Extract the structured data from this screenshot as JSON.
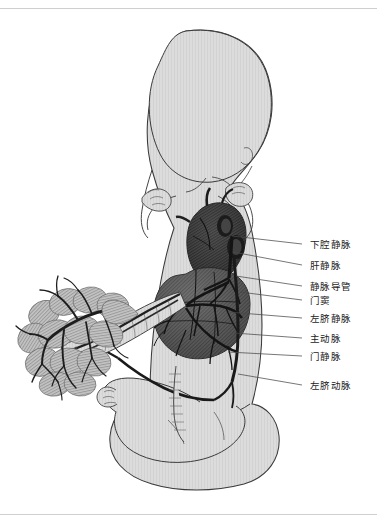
{
  "figure": {
    "type": "anatomical-illustration",
    "palette": {
      "background": "#ffffff",
      "body_fill": "#dcdcdc",
      "body_outline": "#3a3a3a",
      "organ_dark": "#2e2e2e",
      "organ_mid": "#575757",
      "organ_light": "#8a8a8a",
      "placenta_fill": "#b9b9b9",
      "vessel_dark": "#262626",
      "leader_line": "#4a4a4a",
      "border_rule": "#cfcfcf",
      "label_text": "#1c1c1c"
    },
    "rules": [
      {
        "name": "top-rule",
        "y": 8
      },
      {
        "name": "bottom-rule",
        "y": 514
      }
    ]
  },
  "labels": [
    {
      "id": "ivc",
      "text": "下腔静脉",
      "x": 310,
      "y": 239,
      "leader": {
        "x1": 302,
        "y1": 244,
        "x2": 232,
        "y2": 236
      }
    },
    {
      "id": "hepatic-vein",
      "text": "肝静脉",
      "x": 310,
      "y": 260,
      "leader": {
        "x1": 302,
        "y1": 265,
        "x2": 233,
        "y2": 252
      }
    },
    {
      "id": "ductus-venosus",
      "text": "静脉导管",
      "x": 310,
      "y": 281,
      "leader": {
        "x1": 302,
        "y1": 286,
        "x2": 236,
        "y2": 276
      }
    },
    {
      "id": "portal-sinus",
      "text": "门窦",
      "x": 310,
      "y": 295,
      "leader": {
        "x1": 302,
        "y1": 300,
        "x2": 240,
        "y2": 292
      }
    },
    {
      "id": "left-umb-vein",
      "text": "左脐静脉",
      "x": 310,
      "y": 313,
      "leader": {
        "x1": 302,
        "y1": 318,
        "x2": 228,
        "y2": 312
      }
    },
    {
      "id": "aorta",
      "text": "主动脉",
      "x": 310,
      "y": 333,
      "leader": {
        "x1": 302,
        "y1": 338,
        "x2": 234,
        "y2": 333
      }
    },
    {
      "id": "portal-vein",
      "text": "门静脉",
      "x": 310,
      "y": 351,
      "leader": {
        "x1": 302,
        "y1": 356,
        "x2": 228,
        "y2": 352
      }
    },
    {
      "id": "left-umb-artery",
      "text": "左脐动脉",
      "x": 310,
      "y": 380,
      "leader": {
        "x1": 302,
        "y1": 385,
        "x2": 238,
        "y2": 374
      }
    }
  ],
  "regions": [
    {
      "name": "fetus-body",
      "description": "胎儿轮廓"
    },
    {
      "name": "fetal-head",
      "description": "头部"
    },
    {
      "name": "heart",
      "description": "心脏"
    },
    {
      "name": "liver",
      "description": "肝脏"
    },
    {
      "name": "placenta",
      "description": "胎盘"
    },
    {
      "name": "umbilical-cord",
      "description": "脐带"
    }
  ]
}
